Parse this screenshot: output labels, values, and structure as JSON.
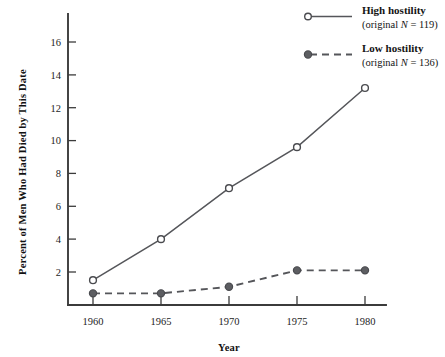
{
  "chart_data": {
    "type": "line",
    "title": "",
    "xlabel": "Year",
    "ylabel": "Percent of Men Who Had Died by This Date",
    "x": [
      1960,
      1965,
      1970,
      1975,
      1980
    ],
    "categories": [
      "1960",
      "1965",
      "1970",
      "1975",
      "1980"
    ],
    "xlim": [
      1958,
      1982
    ],
    "ylim": [
      0,
      17.2
    ],
    "yticks": [
      2,
      4,
      6,
      8,
      10,
      12,
      14,
      16
    ],
    "ytick_labels": [
      "2",
      "4",
      "6",
      "8",
      "10",
      "12",
      "14",
      "16"
    ],
    "xtick_labels": [
      "1960",
      "1965",
      "1970",
      "1975",
      "1980"
    ],
    "grid": false,
    "legend_position": "top-right",
    "series": [
      {
        "name": "High hostility",
        "sub_label": "(original N = 119)",
        "n": 119,
        "marker": "open-circle",
        "line_style": "solid",
        "color": "#55565a",
        "values": [
          1.5,
          4.0,
          7.1,
          9.6,
          13.2
        ]
      },
      {
        "name": "Low hostility",
        "sub_label": "(original N = 136)",
        "n": 136,
        "marker": "filled-circle",
        "line_style": "dashed",
        "color": "#55565a",
        "values": [
          0.7,
          0.7,
          1.1,
          2.1,
          2.1
        ]
      }
    ]
  },
  "legend": {
    "entries": [
      {
        "label": "High hostility",
        "sub_prefix": "(original ",
        "sub_italic": "N",
        "sub_suffix": " = 119)"
      },
      {
        "label": "Low hostility",
        "sub_prefix": "(original ",
        "sub_italic": "N",
        "sub_suffix": " = 136)"
      }
    ]
  }
}
